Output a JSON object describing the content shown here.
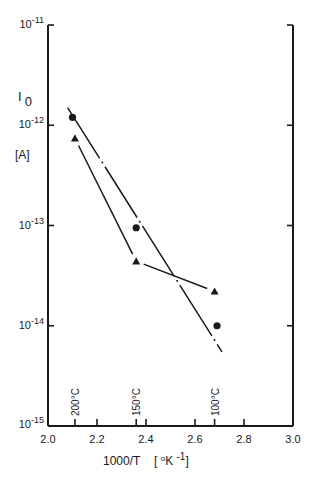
{
  "chart_data": {
    "type": "scatter",
    "title": "",
    "xlabel": "1000/T",
    "xlabel_unit": "[°K -1]",
    "ylabel": "I 0",
    "ylabel_unit": "[A]",
    "xlim": [
      2.0,
      3.0
    ],
    "ylim": [
      1e-15,
      1e-11
    ],
    "yscale": "log",
    "grid": false,
    "x_ticks": [
      "2.0",
      "2.2",
      "2.4",
      "2.6",
      "2.8",
      "3.0"
    ],
    "y_ticks": [
      {
        "base": "10",
        "exp": "-11",
        "value": 1e-11
      },
      {
        "base": "10",
        "exp": "-12",
        "value": 1e-12
      },
      {
        "base": "10",
        "exp": "-13",
        "value": 1e-13
      },
      {
        "base": "10",
        "exp": "-14",
        "value": 1e-14
      },
      {
        "base": "10",
        "exp": "-15",
        "value": 1e-15
      }
    ],
    "temperature_annotations": [
      {
        "label": "200°C",
        "x": 2.11
      },
      {
        "label": "150°C",
        "x": 2.36
      },
      {
        "label": "100°C",
        "x": 2.68
      }
    ],
    "series": [
      {
        "name": "circles",
        "marker": "circle",
        "line_style": "dash-dot",
        "x": [
          2.1,
          2.36,
          2.69
        ],
        "y": [
          1.2e-12,
          9.5e-14,
          1e-14
        ],
        "fit_line": {
          "x": [
            2.08,
            2.71
          ],
          "y": [
            1.5e-12,
            5.5e-15
          ]
        }
      },
      {
        "name": "triangles",
        "marker": "triangle",
        "line_style": "solid",
        "x": [
          2.11,
          2.36,
          2.68
        ],
        "y": [
          7.4e-13,
          4.4e-14,
          2.2e-14
        ]
      }
    ],
    "legend": "none"
  },
  "colors": {
    "ink": "#1a1a1a",
    "background": "#ffffff"
  }
}
